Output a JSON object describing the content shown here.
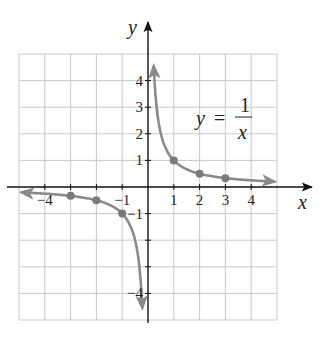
{
  "chart_data": {
    "type": "line",
    "title": "",
    "equation": {
      "lhs": "y",
      "equals": "=",
      "numerator": "1",
      "denominator": "x"
    },
    "xlabel": "x",
    "ylabel": "y",
    "xlim": [
      -5,
      5
    ],
    "ylim": [
      -5,
      5
    ],
    "grid": true,
    "x_tick_labels": [
      {
        "value": -4,
        "label": "−4"
      },
      {
        "value": -1,
        "label": "−1"
      },
      {
        "value": 1,
        "label": "1"
      },
      {
        "value": 2,
        "label": "2"
      },
      {
        "value": 3,
        "label": "3"
      },
      {
        "value": 4,
        "label": "4"
      }
    ],
    "y_tick_labels": [
      {
        "value": 4,
        "label": "4"
      },
      {
        "value": 3,
        "label": "3"
      },
      {
        "value": 2,
        "label": "2"
      },
      {
        "value": 1,
        "label": "1"
      },
      {
        "value": -1,
        "label": "−1"
      },
      {
        "value": -4,
        "label": "−4"
      }
    ],
    "series": [
      {
        "name": "y = 1/x (x > 0)",
        "function": "1/x",
        "x_range": [
          0.22,
          4.9
        ],
        "arrows": "both",
        "points": [
          {
            "x": 1,
            "y": 1
          },
          {
            "x": 2,
            "y": 0.5
          },
          {
            "x": 3,
            "y": 0.333
          }
        ]
      },
      {
        "name": "y = 1/x (x < 0)",
        "function": "1/x",
        "x_range": [
          -4.9,
          -0.22
        ],
        "arrows": "both",
        "points": [
          {
            "x": -3,
            "y": -0.333
          },
          {
            "x": -2,
            "y": -0.5
          },
          {
            "x": -1,
            "y": -1
          }
        ]
      }
    ]
  },
  "colors": {
    "grid": "#c8c8c8",
    "axis": "#111111",
    "curve": "#8a8a8a",
    "point": "#7a7a7a"
  }
}
